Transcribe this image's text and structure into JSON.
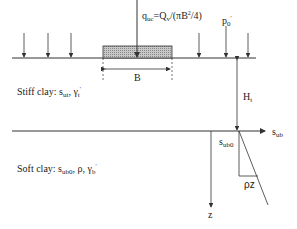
{
  "labels": {
    "load": {
      "base": "q",
      "sub": "uc",
      "rest_1": "=Q",
      "sub2": "v",
      "rest_2": "/(",
      "pi": "π",
      "rest_3": "B",
      "sup": "2",
      "rest_4": "/4)"
    },
    "surcharge": {
      "base": "p",
      "sub": "0",
      "prime": "'"
    },
    "width": "B",
    "thickness": {
      "base": "H",
      "sub": "t"
    },
    "stiff_clay": {
      "text": "Stiff clay: s",
      "sub1": "ut",
      "mid": ", γ",
      "sub2": "t",
      "prime": "'"
    },
    "soft_clay": {
      "text": "Soft clay: s",
      "sub1": "ub0",
      "mid": ", ρ, γ",
      "sub2": "b",
      "prime": "'"
    },
    "x_axis": {
      "base": "s",
      "sub": "ub"
    },
    "intercept": {
      "base": "s",
      "sub": "ub0"
    },
    "gradient": "ρz",
    "z_axis": "z"
  },
  "colors": {
    "line": "#333333",
    "hatch": "#9a9a9a"
  }
}
